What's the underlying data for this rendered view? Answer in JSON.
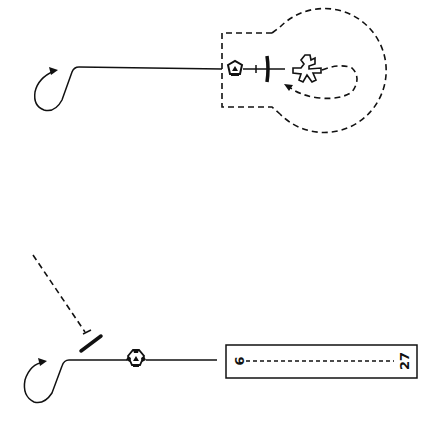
{
  "diagram": {
    "type": "aviation-approach-procedure-diagram",
    "colors": {
      "ink": "#111111",
      "background": "#ffffff"
    },
    "top_panel": {
      "name": "holding-pattern-over-vor-with-airport",
      "elements": [
        "procedure-turn-arrow",
        "inbound-course-line",
        "vor-station-symbol",
        "aircraft-symbol",
        "airport-symbol",
        "dashed-holding-track",
        "dashed-airspace-boundary"
      ]
    },
    "bottom_panel": {
      "name": "straight-in-approach-to-runway",
      "elements": [
        "dashed-inbound-track",
        "aircraft-symbol",
        "procedure-turn-arrow",
        "vor-station-symbol",
        "runway-rectangle"
      ],
      "runway": {
        "left_label": "9",
        "right_label": "27",
        "centerline": "dashed"
      }
    }
  }
}
